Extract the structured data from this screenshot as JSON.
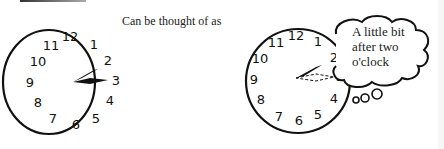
{
  "caption": "Can be thought of as",
  "thought_bubble": {
    "text": "A little bit\nafter two\no'clock"
  },
  "clocks": [
    {
      "id": "actual-clock",
      "numbers": [
        "12",
        "1",
        "2",
        "3",
        "4",
        "5",
        "6",
        "7",
        "8",
        "9",
        "10",
        "11"
      ],
      "hour_hand": "pointing between 2 and 3",
      "minute_hand": "pointing at 3"
    },
    {
      "id": "thought-clock",
      "numbers": [
        "12",
        "1",
        "2",
        "3",
        "4",
        "5",
        "6",
        "7",
        "8",
        "9",
        "10",
        "11"
      ],
      "hour_hand": "pointing between 2 and 3",
      "minute_hand": "dashed outline pointing at 3"
    }
  ]
}
